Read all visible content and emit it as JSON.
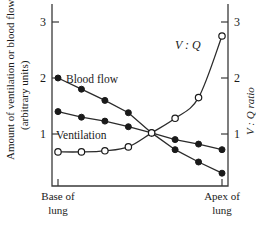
{
  "chart_data": {
    "type": "line",
    "title": "",
    "subtitle": "",
    "ylabel": "Amount of ventilation or blood flow",
    "ylabel_line2": "(arbitrary units)",
    "y2label": "V : Q ratio",
    "xlabel": "",
    "x_category_left": "Base of",
    "x_category_left_line2": "lung",
    "x_category_right": "Apex of",
    "x_category_right_line2": "lung",
    "ylim": [
      0,
      3.3
    ],
    "y2lim": [
      0,
      3.3
    ],
    "yticks": [
      1,
      2,
      3
    ],
    "y2ticks": [
      1,
      2,
      3
    ],
    "ytick_labels": [
      "1",
      "2",
      "3"
    ],
    "y2tick_labels": [
      "1",
      "2",
      "3"
    ],
    "xlim": [
      0,
      1
    ],
    "grid": false,
    "legend_position": "inline-annotations",
    "x": [
      0.0,
      0.143,
      0.286,
      0.429,
      0.571,
      0.714,
      0.857,
      1.0
    ],
    "series": [
      {
        "name": "Blood flow",
        "label": "Blood flow",
        "marker": "filled-circle",
        "axis": "left",
        "values": [
          2.0,
          1.8,
          1.6,
          1.38,
          1.02,
          0.72,
          0.5,
          0.3
        ]
      },
      {
        "name": "Ventilation",
        "label": "Ventilation",
        "marker": "filled-circle",
        "axis": "left",
        "values": [
          1.4,
          1.3,
          1.23,
          1.13,
          1.02,
          0.9,
          0.82,
          0.72
        ]
      },
      {
        "name": "V:Q ratio",
        "label": "V : Q",
        "marker": "open-circle",
        "axis": "right",
        "values": [
          0.68,
          0.68,
          0.7,
          0.77,
          1.02,
          1.28,
          1.65,
          2.75
        ]
      }
    ],
    "annotations": [
      {
        "text": "Blood flow",
        "x": 0.12,
        "y": 2.02,
        "style": "plain"
      },
      {
        "text": "Ventilation",
        "x": 0.03,
        "y": 1.0,
        "style": "plain"
      },
      {
        "text": "V : Q",
        "x": 0.76,
        "y": 2.55,
        "style": "italic"
      }
    ]
  }
}
